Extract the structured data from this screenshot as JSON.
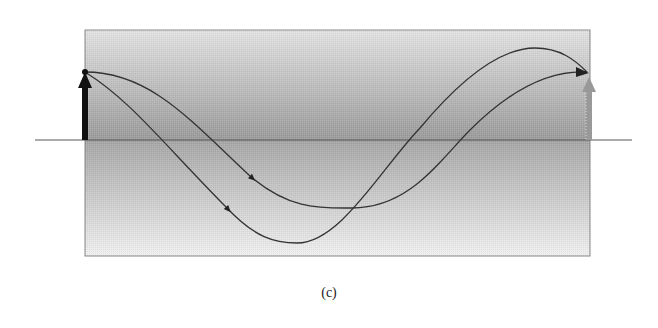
{
  "figure": {
    "caption": "(c)",
    "panel": {
      "x": 85,
      "y": 30,
      "width": 505,
      "height": 226,
      "border_color": "#888888",
      "gradient_stops": [
        {
          "offset": 0.0,
          "color": "#e2e2e2"
        },
        {
          "offset": 0.48,
          "color": "#9c9c9c"
        },
        {
          "offset": 0.5,
          "color": "#a8a8a8"
        },
        {
          "offset": 1.0,
          "color": "#f0f0f0"
        }
      ]
    },
    "axis_line": {
      "x1": 35,
      "x2": 632,
      "y": 140,
      "color": "#555555"
    },
    "start_arrow": {
      "x": 85,
      "y_base": 140,
      "y_tip": 72,
      "color": "#111111",
      "label": "initial state vector"
    },
    "end_arrow": {
      "x": 589,
      "y_base": 140,
      "y_tip": 77,
      "color": "#999999",
      "label": "final state vector"
    },
    "start_point": {
      "x": 85,
      "y": 72
    },
    "end_point": {
      "x": 587,
      "y": 72
    },
    "paths": [
      {
        "name": "shallow-path",
        "color": "#333333",
        "d": "M85,72 C150,72 190,120 250,176 C290,210 320,208 352,208 C410,208 440,160 470,130 C510,90 550,70 587,72",
        "arrow_at": {
          "x": 250,
          "y": 176,
          "angle": 42
        }
      },
      {
        "name": "deep-path",
        "color": "#333333",
        "d": "M85,72 C130,100 160,140 226,207 C255,238 275,243 297,243 C340,243 380,170 420,128 C460,80 500,48 535,48 C560,48 575,60 587,72",
        "arrow_at": {
          "x": 226,
          "y": 207,
          "angle": 48
        }
      }
    ]
  }
}
